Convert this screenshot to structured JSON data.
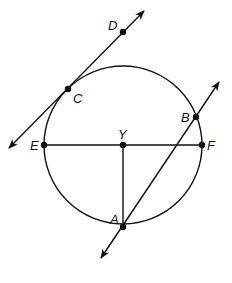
{
  "diagram": {
    "type": "circle-geometry",
    "circle": {
      "center_label": "Y",
      "cx": 123,
      "cy": 145,
      "r": 79
    },
    "points": [
      {
        "label": "D",
        "x": 123,
        "y": 32,
        "lx": 108,
        "ly": 30
      },
      {
        "label": "C",
        "x": 68,
        "y": 89,
        "lx": 73,
        "ly": 103
      },
      {
        "label": "B",
        "x": 196,
        "y": 117,
        "lx": 181,
        "ly": 122
      },
      {
        "label": "E",
        "x": 44,
        "y": 145,
        "lx": 30,
        "ly": 150
      },
      {
        "label": "Y",
        "x": 123,
        "y": 145,
        "lx": 118,
        "ly": 139
      },
      {
        "label": "F",
        "x": 202,
        "y": 145,
        "lx": 207,
        "ly": 150
      },
      {
        "label": "A",
        "x": 123,
        "y": 227,
        "lx": 110,
        "ly": 224
      }
    ],
    "lines": [
      {
        "name": "tangent-line-CD",
        "x1": 9,
        "y1": 148,
        "x2": 144,
        "y2": 11,
        "arrows": "both"
      },
      {
        "name": "secant-line-AB",
        "x1": 101,
        "y1": 258,
        "x2": 219,
        "y2": 82,
        "arrows": "both"
      }
    ],
    "segments": [
      {
        "name": "diameter-EF",
        "x1": 44,
        "y1": 145,
        "x2": 202,
        "y2": 145
      },
      {
        "name": "radius-YA",
        "x1": 123,
        "y1": 145,
        "x2": 123,
        "y2": 227
      }
    ]
  }
}
